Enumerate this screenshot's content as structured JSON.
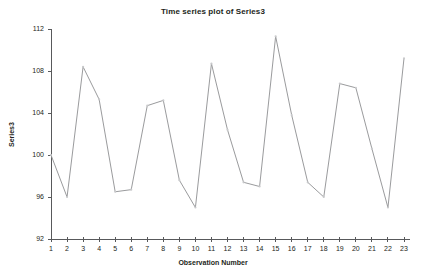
{
  "chart_data": {
    "type": "line",
    "title": "Time series plot of Series3",
    "xlabel": "Observation Number",
    "ylabel": "Series3",
    "series_name": "Series3",
    "x": [
      1,
      2,
      3,
      4,
      5,
      6,
      7,
      8,
      9,
      10,
      11,
      12,
      13,
      14,
      15,
      16,
      17,
      18,
      19,
      20,
      21,
      22,
      23
    ],
    "values": [
      100.0,
      96.0,
      108.4,
      105.3,
      96.5,
      96.7,
      104.7,
      105.2,
      97.6,
      95.0,
      108.7,
      102.4,
      97.4,
      97.0,
      111.3,
      103.8,
      97.4,
      96.0,
      106.8,
      106.4,
      100.6,
      95.0,
      109.2
    ],
    "xlim": [
      1,
      23
    ],
    "ylim": [
      92,
      112
    ],
    "xticks": [
      1,
      2,
      3,
      4,
      5,
      6,
      7,
      8,
      9,
      10,
      11,
      12,
      13,
      14,
      15,
      16,
      17,
      18,
      19,
      20,
      21,
      22,
      23
    ],
    "yticks": [
      92,
      96,
      100,
      104,
      108,
      112
    ],
    "grid": false,
    "legend": false,
    "line_color": "#9a9b9d",
    "marker_color": "#c9cacc",
    "axis_color": "#58595b",
    "background": "#ffffff"
  }
}
